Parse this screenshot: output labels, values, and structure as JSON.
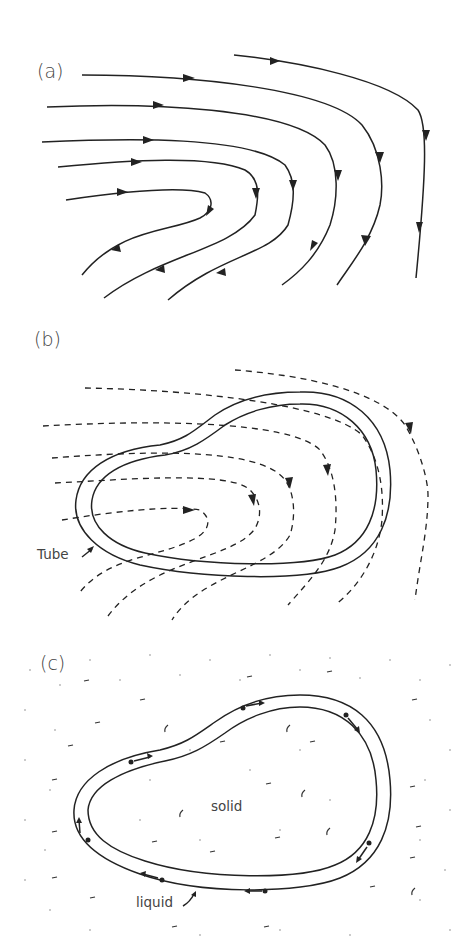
{
  "figure": {
    "panels": [
      {
        "id": "a",
        "label": "(a)",
        "description": "Streamlines of flow with arrows curving around a turning point"
      },
      {
        "id": "b",
        "label": "(b)",
        "description": "Dashed streamlines with a closed tube overlaid",
        "annotation": "Tube"
      },
      {
        "id": "c",
        "label": "(c)",
        "description": "Closed tube of liquid inside solid, with particles moving along tube",
        "annotation_inside": "solid",
        "annotation_tube": "liquid"
      }
    ]
  },
  "colors": {
    "stroke": "#222222",
    "text": "#444444",
    "background": "#ffffff"
  }
}
